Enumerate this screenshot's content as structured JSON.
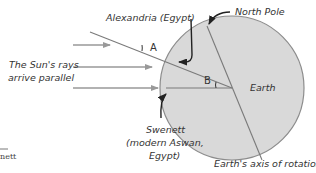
{
  "labels": {
    "alexandria": "Alexandria (Egypt)",
    "north_pole": "North Pole",
    "suns_rays_line1": "The Sun's rays",
    "suns_rays_line2": "arrive parallel",
    "angle_a": "A",
    "angle_b": "B",
    "earth": "Earth",
    "swenett_line1": "Swenett",
    "swenett_line2": "(modern Aswan,",
    "swenett_line3": "Egypt)",
    "axis": "Earth's axis of rotation",
    "cropped_fragment": "nett"
  },
  "colors": {
    "earth_fill": "#d9d9d9",
    "earth_stroke": "#8c8c8c",
    "ray_color": "#999999",
    "line_color": "#7a7a7a",
    "pointer_color": "#222222",
    "text_color": "#333333"
  }
}
